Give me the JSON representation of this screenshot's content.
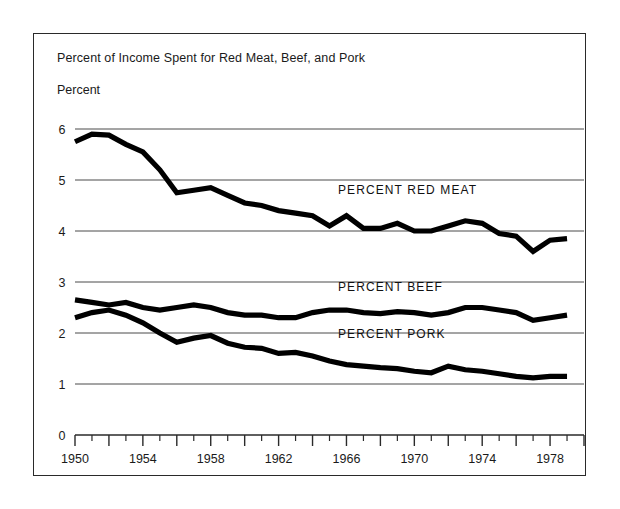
{
  "chart_data": {
    "type": "line",
    "title": "Percent of Income Spent for Red Meat, Beef, and Pork",
    "ylabel": "Percent",
    "xlabel": "",
    "ylim": [
      0,
      6
    ],
    "xlim": [
      1950,
      1980
    ],
    "grid": true,
    "legend_position": "inline-annotation",
    "y_ticks": [
      0,
      1,
      2,
      3,
      4,
      5,
      6
    ],
    "x_ticks_major": [
      1950,
      1954,
      1958,
      1962,
      1966,
      1970,
      1974,
      1978
    ],
    "x_tick_labels": [
      "1950",
      "1954",
      "1958",
      "1962",
      "1966",
      "1970",
      "1974",
      "1978"
    ],
    "x": [
      1950,
      1951,
      1952,
      1953,
      1954,
      1955,
      1956,
      1957,
      1958,
      1959,
      1960,
      1961,
      1962,
      1963,
      1964,
      1965,
      1966,
      1967,
      1968,
      1969,
      1970,
      1971,
      1972,
      1973,
      1974,
      1975,
      1976,
      1977,
      1978,
      1979
    ],
    "series": [
      {
        "name": "PERCENT RED MEAT",
        "label": "PERCENT RED MEAT",
        "values": [
          5.75,
          5.9,
          5.88,
          5.7,
          5.55,
          5.2,
          4.75,
          4.8,
          4.85,
          4.7,
          4.55,
          4.5,
          4.4,
          4.35,
          4.3,
          4.1,
          4.3,
          4.05,
          4.05,
          4.15,
          4.0,
          4.0,
          4.1,
          4.2,
          4.15,
          3.95,
          3.9,
          3.6,
          3.82,
          3.85
        ]
      },
      {
        "name": "PERCENT BEEF",
        "label": "PERCENT BEEF",
        "values": [
          2.65,
          2.6,
          2.55,
          2.6,
          2.5,
          2.45,
          2.5,
          2.55,
          2.5,
          2.4,
          2.35,
          2.35,
          2.3,
          2.3,
          2.4,
          2.45,
          2.45,
          2.4,
          2.38,
          2.42,
          2.4,
          2.35,
          2.4,
          2.5,
          2.5,
          2.45,
          2.4,
          2.25,
          2.3,
          2.35
        ]
      },
      {
        "name": "PERCENT PORK",
        "label": "PERCENT PORK",
        "values": [
          2.3,
          2.4,
          2.45,
          2.35,
          2.2,
          2.0,
          1.82,
          1.9,
          1.95,
          1.8,
          1.72,
          1.7,
          1.6,
          1.62,
          1.55,
          1.45,
          1.38,
          1.35,
          1.32,
          1.3,
          1.25,
          1.22,
          1.35,
          1.28,
          1.25,
          1.2,
          1.15,
          1.12,
          1.15,
          1.15
        ]
      }
    ],
    "annotations": [
      {
        "text": "PERCENT RED MEAT",
        "x": 1965.5,
        "y": 4.72
      },
      {
        "text": "PERCENT BEEF",
        "x": 1965.5,
        "y": 2.82
      },
      {
        "text": "PERCENT PORK",
        "x": 1965.5,
        "y": 1.9
      }
    ]
  },
  "colors": {
    "line": "#000000",
    "grid": "#4a4a4a",
    "frame": "#2a2a2a",
    "background": "#ffffff",
    "text": "#1a1a1a"
  }
}
